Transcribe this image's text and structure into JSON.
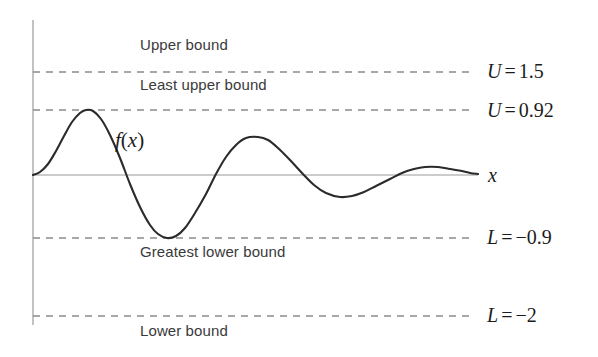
{
  "figure": {
    "background_color": "#ffffff",
    "curve_color": "#2b2b2b",
    "axis_color": "#9a9a9a",
    "dash_color": "#8c8c8c"
  },
  "axes": {
    "x_axis_label": "x",
    "y_axis_label": "",
    "function_label": "f(x)",
    "function_label_parts": {
      "f": "f",
      "open": "(",
      "var": "x",
      "close": ")"
    }
  },
  "bound_lines": [
    {
      "id": "upper-bound",
      "caption": "Upper bound",
      "label_symbol": "U",
      "label_operator": "=",
      "label_value": "1.5",
      "value": 1.5,
      "y_px": 72,
      "caption_x_px": 140,
      "caption_y_px": 36,
      "label_x_px": 487,
      "label_y_px": 60
    },
    {
      "id": "least-upper-bound",
      "caption": "Least upper bound",
      "label_symbol": "U",
      "label_operator": "=",
      "label_value": "0.92",
      "value": 0.92,
      "y_px": 110,
      "caption_x_px": 140,
      "caption_y_px": 76,
      "label_x_px": 487,
      "label_y_px": 99
    },
    {
      "id": "greatest-lower-bound",
      "caption": "Greatest lower bound",
      "label_symbol": "L",
      "label_operator": "=",
      "label_value": "−0.9",
      "value": -0.9,
      "y_px": 238,
      "caption_x_px": 140,
      "caption_y_px": 243,
      "label_x_px": 487,
      "label_y_px": 226
    },
    {
      "id": "lower-bound",
      "caption": "Lower bound",
      "label_symbol": "L",
      "label_operator": "=",
      "label_value": "−2",
      "value": -2.0,
      "y_px": 316,
      "caption_x_px": 140,
      "caption_y_px": 322,
      "label_x_px": 487,
      "label_y_px": 304
    }
  ],
  "chart_data": {
    "type": "line",
    "title": "",
    "subtitle": "",
    "xlabel": "x",
    "ylabel": "",
    "grid": false,
    "legend": null,
    "ylim": [
      -2.4,
      2.0
    ],
    "xlim": [
      0,
      10
    ],
    "series": [
      {
        "name": "f(x)",
        "description": "damped oscillation starting at the origin",
        "color": "#2b2b2b",
        "points_px": [
          [
            33,
            175
          ],
          [
            40,
            172
          ],
          [
            48,
            164
          ],
          [
            56,
            151
          ],
          [
            64,
            136
          ],
          [
            72,
            122
          ],
          [
            80,
            113
          ],
          [
            86,
            110
          ],
          [
            93,
            111
          ],
          [
            101,
            119
          ],
          [
            110,
            135
          ],
          [
            120,
            158
          ],
          [
            130,
            184
          ],
          [
            140,
            207
          ],
          [
            150,
            225
          ],
          [
            158,
            234
          ],
          [
            167,
            238
          ],
          [
            176,
            236
          ],
          [
            185,
            228
          ],
          [
            195,
            213
          ],
          [
            206,
            194
          ],
          [
            216,
            174
          ],
          [
            226,
            157
          ],
          [
            236,
            145
          ],
          [
            246,
            138
          ],
          [
            258,
            137
          ],
          [
            268,
            140
          ],
          [
            278,
            148
          ],
          [
            290,
            160
          ],
          [
            302,
            173
          ],
          [
            314,
            185
          ],
          [
            326,
            193
          ],
          [
            340,
            197
          ],
          [
            352,
            196
          ],
          [
            364,
            192
          ],
          [
            376,
            186
          ],
          [
            390,
            179
          ],
          [
            402,
            173
          ],
          [
            414,
            169
          ],
          [
            425,
            167
          ],
          [
            438,
            167
          ],
          [
            450,
            169
          ],
          [
            462,
            171
          ],
          [
            470,
            173
          ],
          [
            478,
            174
          ]
        ],
        "key_points": [
          {
            "name": "origin",
            "x_px": 33,
            "y_px": 175,
            "value": 0
          },
          {
            "name": "first-peak",
            "x_px": 86,
            "y_px": 110,
            "value": 0.92
          },
          {
            "name": "first-trough",
            "x_px": 167,
            "y_px": 238,
            "value": -0.9
          },
          {
            "name": "second-peak",
            "x_px": 258,
            "y_px": 137,
            "value": 0.54
          },
          {
            "name": "second-trough",
            "x_px": 340,
            "y_px": 197,
            "value": -0.31
          },
          {
            "name": "third-peak",
            "x_px": 425,
            "y_px": 167,
            "value": 0.12
          },
          {
            "name": "tail-end",
            "x_px": 478,
            "y_px": 174,
            "value": 0.01
          }
        ]
      }
    ],
    "reference_lines": [
      {
        "label": "U = 1.5",
        "value": 1.5,
        "style": "dashed"
      },
      {
        "label": "U = 0.92",
        "value": 0.92,
        "style": "dashed"
      },
      {
        "label": "L = -0.9",
        "value": -0.9,
        "style": "dashed"
      },
      {
        "label": "L = -2",
        "value": -2.0,
        "style": "dashed"
      }
    ],
    "annotations": [
      "Upper bound",
      "Least upper bound",
      "f(x)",
      "Greatest lower bound",
      "Lower bound",
      "x"
    ]
  },
  "geometry": {
    "y_axis_x_px": 33,
    "y_axis_top_px": 20,
    "y_axis_bottom_px": 325,
    "x_axis_y_px": 175,
    "x_axis_left_px": 33,
    "x_axis_right_px": 478,
    "dash_left_px": 33,
    "dash_right_px": 472,
    "function_label_x_px": 115,
    "function_label_y_px": 128,
    "x_label_x_px": 488,
    "x_label_y_px": 164
  }
}
